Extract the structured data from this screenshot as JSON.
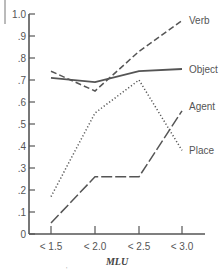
{
  "chart_data": {
    "type": "line",
    "title": "",
    "xlabel": "MLU",
    "ylabel": "",
    "categories": [
      "< 1.5",
      "< 2.0",
      "< 2.5",
      "< 3.0"
    ],
    "ylim": [
      0,
      1.0
    ],
    "yticks": [
      "0",
      ".1",
      ".2",
      ".3",
      ".4",
      ".5",
      ".6",
      ".7",
      ".8",
      ".9",
      "1.0"
    ],
    "grid": false,
    "legend_position": "inline-right",
    "series": [
      {
        "name": "Verb",
        "style": "dashed",
        "values": [
          0.74,
          0.65,
          0.83,
          0.97
        ]
      },
      {
        "name": "Object",
        "style": "solid",
        "values": [
          0.71,
          0.69,
          0.74,
          0.75
        ]
      },
      {
        "name": "Agent",
        "style": "long-dash",
        "values": [
          0.05,
          0.26,
          0.26,
          0.56
        ]
      },
      {
        "name": "Place",
        "style": "dotted",
        "values": [
          0.17,
          0.55,
          0.7,
          0.38
        ]
      }
    ],
    "colors": {
      "line": "#555555",
      "axis": "#555555",
      "text": "#555555"
    }
  }
}
